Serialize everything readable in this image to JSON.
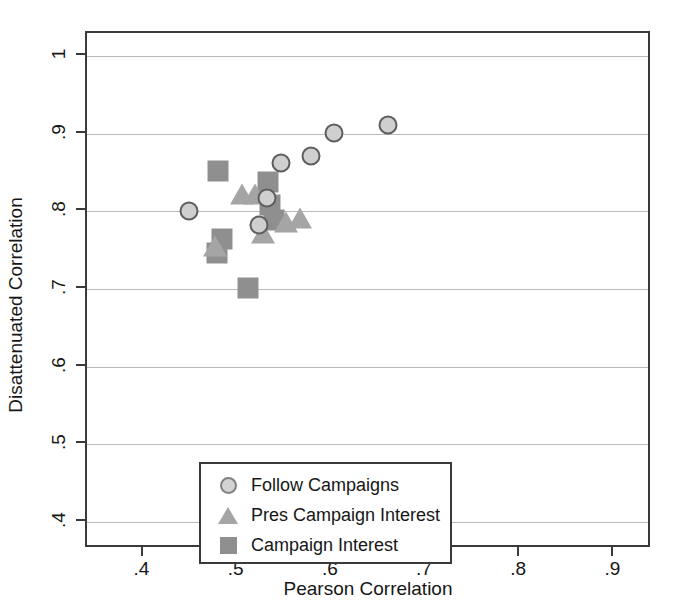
{
  "chart_data": {
    "type": "scatter",
    "title": "",
    "xlabel": "Pearson Correlation",
    "ylabel": "Disattenuated Correlation",
    "xlim": [
      0.34,
      0.94
    ],
    "ylim": [
      0.365,
      1.03
    ],
    "xticks": [
      ".4",
      ".5",
      ".6",
      ".7",
      ".8",
      ".9",
      "1"
    ],
    "xtick_values": [
      0.4,
      0.5,
      0.6,
      0.7,
      0.8,
      0.9,
      1.0
    ],
    "yticks": [
      ".4",
      ".5",
      ".6",
      ".7",
      ".8",
      ".9",
      "1"
    ],
    "ytick_values": [
      0.4,
      0.5,
      0.6,
      0.7,
      0.8,
      0.9,
      1.0
    ],
    "grid": "horizontal",
    "legend_position": "lower-left-inside",
    "series": [
      {
        "name": "Follow Campaigns",
        "marker": "circle",
        "color": "#cfcfcf",
        "edge_color": "#5e5e5e",
        "points": [
          {
            "x": 0.448,
            "y": 0.801
          },
          {
            "x": 0.523,
            "y": 0.782
          },
          {
            "x": 0.531,
            "y": 0.817
          },
          {
            "x": 0.546,
            "y": 0.862
          },
          {
            "x": 0.578,
            "y": 0.871
          },
          {
            "x": 0.602,
            "y": 0.901
          },
          {
            "x": 0.66,
            "y": 0.911
          }
        ]
      },
      {
        "name": "Pres Campaign Interest",
        "marker": "triangle",
        "color": "#a5a5a5",
        "points": [
          {
            "x": 0.476,
            "y": 0.755
          },
          {
            "x": 0.505,
            "y": 0.822
          },
          {
            "x": 0.518,
            "y": 0.823
          },
          {
            "x": 0.527,
            "y": 0.772
          },
          {
            "x": 0.551,
            "y": 0.786
          },
          {
            "x": 0.566,
            "y": 0.791
          }
        ]
      },
      {
        "name": "Campaign Interest",
        "marker": "square",
        "color": "#8f8f8f",
        "points": [
          {
            "x": 0.479,
            "y": 0.852
          },
          {
            "x": 0.483,
            "y": 0.764
          },
          {
            "x": 0.478,
            "y": 0.746
          },
          {
            "x": 0.511,
            "y": 0.701
          },
          {
            "x": 0.532,
            "y": 0.838
          },
          {
            "x": 0.534,
            "y": 0.808
          },
          {
            "x": 0.539,
            "y": 0.789
          }
        ]
      }
    ]
  },
  "legend": {
    "items": [
      {
        "label": "Follow Campaigns",
        "marker": "circle"
      },
      {
        "label": "Pres Campaign Interest",
        "marker": "triangle"
      },
      {
        "label": "Campaign Interest",
        "marker": "square"
      }
    ]
  }
}
